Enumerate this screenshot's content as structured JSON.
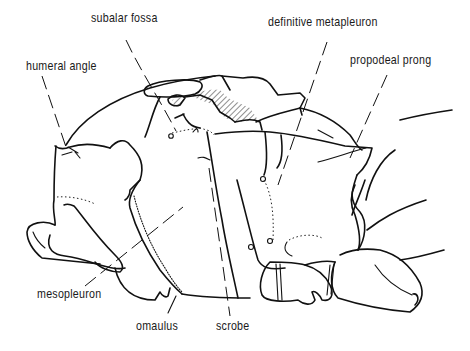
{
  "figure": {
    "labels": [
      {
        "id": "subalar-fossa",
        "text": "subalar fossa",
        "x": 91,
        "y": 17
      },
      {
        "id": "humeral-angle",
        "text": "humeral angle",
        "x": 26,
        "y": 57
      },
      {
        "id": "definitive-metapleuron",
        "text": "definitive metapleuron",
        "x": 268,
        "y": 15
      },
      {
        "id": "propodeal-prong",
        "text": "propodeal prong",
        "x": 350,
        "y": 52
      },
      {
        "id": "mesopleuron",
        "text": "mesopleuron",
        "x": 37,
        "y": 286
      },
      {
        "id": "omaulus",
        "text": "omaulus",
        "x": 136,
        "y": 318
      },
      {
        "id": "scrobe",
        "text": "scrobe",
        "x": 216,
        "y": 318
      }
    ]
  }
}
